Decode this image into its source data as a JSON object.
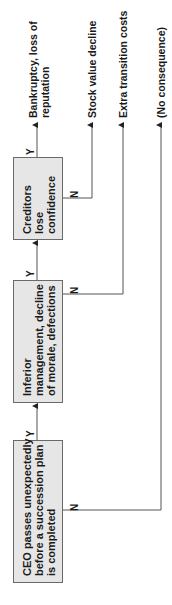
{
  "diagram": {
    "orientation": "rotated -90deg",
    "nodes": [
      {
        "id": "ceo",
        "label": "CEO passes unexpectedly\nbefore a succession plan\nis completed"
      },
      {
        "id": "inferior",
        "label": "Inferior\nmanagement, decline\nof morale, defections"
      },
      {
        "id": "creditors",
        "label": "Creditors\nlose\nconfidence"
      }
    ],
    "outcomes": {
      "bankruptcy": "Bankruptcy, loss of\nreputation",
      "stock": "Stock value decline",
      "extra": "Extra transition costs",
      "none": "(No consequence)"
    },
    "branch_labels": {
      "yes": "Y",
      "no": "N"
    },
    "colors": {
      "box_fill": "#e6e6e6",
      "line": "#555555",
      "text": "#1a1a1a"
    }
  }
}
